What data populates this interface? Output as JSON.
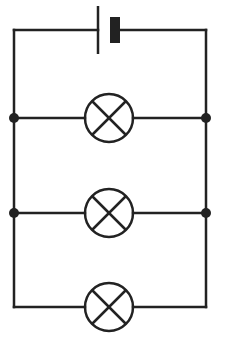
{
  "diagram": {
    "type": "circuit",
    "colors": {
      "wire": "#222222",
      "background": "#ffffff"
    },
    "components": [
      {
        "id": "cell",
        "kind": "cell-icon"
      },
      {
        "id": "lamp-1",
        "kind": "lamp-icon"
      },
      {
        "id": "lamp-2",
        "kind": "lamp-icon"
      },
      {
        "id": "lamp-3",
        "kind": "lamp-icon"
      }
    ],
    "junctions": 4
  }
}
